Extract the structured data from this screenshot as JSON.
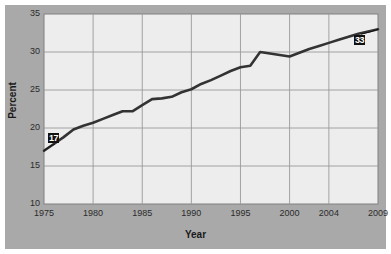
{
  "chart_data": {
    "type": "line",
    "title": "",
    "xlabel": "Year",
    "ylabel": "Percent",
    "ylim": [
      10,
      35
    ],
    "yticks": [
      10,
      15,
      20,
      25,
      30,
      35
    ],
    "xlim": [
      1975,
      2009
    ],
    "xticks": [
      1975,
      1980,
      1985,
      1990,
      1995,
      2000,
      2004,
      2009
    ],
    "xtick_labels": [
      "1975",
      "1980",
      "1985",
      "1990",
      "1995",
      "2000",
      "2004",
      "2009"
    ],
    "grid": true,
    "legend": "none",
    "series": [
      {
        "name": "Percent",
        "x": [
          1975,
          1976,
          1977,
          1978,
          1979,
          1980,
          1981,
          1982,
          1983,
          1984,
          1985,
          1986,
          1987,
          1988,
          1989,
          1990,
          1991,
          1992,
          1993,
          1994,
          1995,
          1996,
          1997,
          1998,
          1999,
          2000,
          2001,
          2002,
          2003,
          2004,
          2005,
          2006,
          2007,
          2008,
          2009
        ],
        "values": [
          17.0,
          17.9,
          18.8,
          19.8,
          20.3,
          20.7,
          21.2,
          21.7,
          22.2,
          22.2,
          23.0,
          23.8,
          23.9,
          24.1,
          24.7,
          25.1,
          25.8,
          26.3,
          26.9,
          27.5,
          28.0,
          28.2,
          30.0,
          29.8,
          29.6,
          29.4,
          29.9,
          30.4,
          30.8,
          31.2,
          31.6,
          32.0,
          32.4,
          32.7,
          33.0
        ]
      }
    ],
    "point_labels": [
      {
        "name": "start-value-label",
        "text": "17",
        "x": 1975,
        "value": 17
      },
      {
        "name": "end-value-label",
        "text": "33",
        "x": 2009,
        "value": 33
      }
    ],
    "colors": {
      "line": "#333333",
      "plot_background": "#ededed",
      "panel_background": "#a9a9a9",
      "grid": "#9a9a9a",
      "axis_text": "#2b2b2b"
    }
  }
}
